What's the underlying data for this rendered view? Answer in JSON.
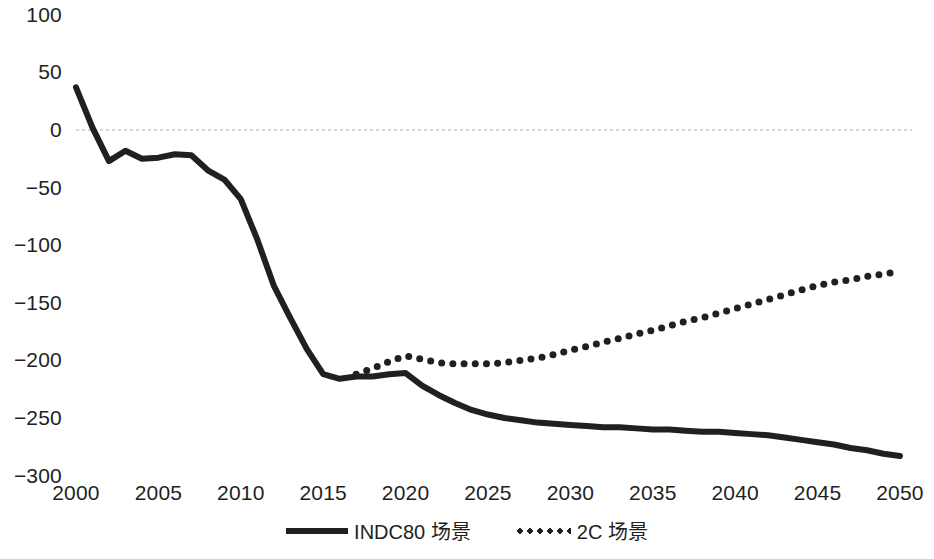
{
  "chart_data": {
    "type": "line",
    "title": "",
    "subtitle": "",
    "xlabel": "",
    "ylabel": "",
    "xlim": [
      2000,
      2050
    ],
    "ylim": [
      -300,
      100
    ],
    "grid": "zero-line-only",
    "legend_position": "bottom-center",
    "x_ticks": [
      "2000",
      "2005",
      "2010",
      "2015",
      "2020",
      "2025",
      "2030",
      "2035",
      "2040",
      "2045",
      "2050"
    ],
    "y_ticks": [
      "100",
      "50",
      "0",
      "−50",
      "−100",
      "−150",
      "−200",
      "−250",
      "−300"
    ],
    "colors": {
      "line": "#231f20",
      "zero_gridline": "#d8d8d8",
      "background": "#ffffff"
    },
    "x": [
      2000,
      2001,
      2002,
      2003,
      2004,
      2005,
      2006,
      2007,
      2008,
      2009,
      2010,
      2011,
      2012,
      2013,
      2014,
      2015,
      2016,
      2017,
      2018,
      2019,
      2020,
      2021,
      2022,
      2023,
      2024,
      2025,
      2026,
      2027,
      2028,
      2029,
      2030,
      2031,
      2032,
      2033,
      2034,
      2035,
      2036,
      2037,
      2038,
      2039,
      2040,
      2041,
      2042,
      2043,
      2044,
      2045,
      2046,
      2047,
      2048,
      2049,
      2050
    ],
    "series": [
      {
        "name": "INDC80 场景",
        "style": "solid",
        "values": [
          37,
          2,
          -27,
          -18,
          -25,
          -24,
          -21,
          -22,
          -35,
          -43,
          -60,
          -95,
          -135,
          -163,
          -190,
          -212,
          -216,
          -214,
          -214,
          -212,
          -211,
          -222,
          -230,
          -237,
          -243,
          -247,
          -250,
          -252,
          -254,
          -255,
          -256,
          -257,
          -258,
          -258,
          -259,
          -260,
          -260,
          -261,
          -262,
          -262,
          -263,
          -264,
          -265,
          -267,
          -269,
          -271,
          -273,
          -276,
          -278,
          -281,
          -283
        ]
      },
      {
        "name": "2C 场景",
        "style": "dotted",
        "values": [
          null,
          null,
          null,
          null,
          null,
          null,
          null,
          null,
          null,
          null,
          null,
          null,
          null,
          null,
          null,
          null,
          null,
          -212,
          -207,
          -201,
          -196,
          -199,
          -202,
          -203,
          -203,
          -203,
          -202,
          -200,
          -198,
          -195,
          -191,
          -188,
          -184,
          -181,
          -177,
          -174,
          -170,
          -166,
          -163,
          -159,
          -155,
          -151,
          -147,
          -143,
          -139,
          -135,
          -132,
          -130,
          -127,
          -125,
          -123
        ]
      }
    ]
  },
  "legend": {
    "entries": [
      {
        "label": "INDC80 场景",
        "style": "solid"
      },
      {
        "label": "2C 场景",
        "style": "dotted"
      }
    ]
  }
}
